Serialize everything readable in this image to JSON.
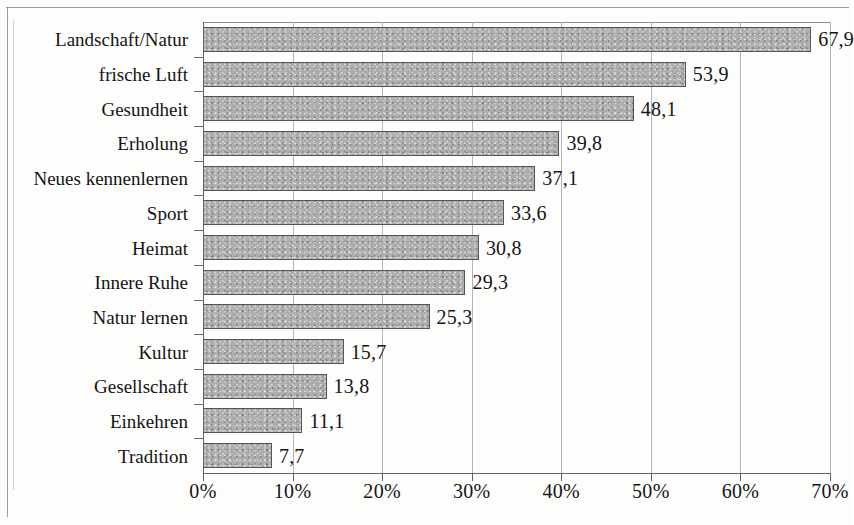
{
  "chart_data": {
    "type": "bar",
    "orientation": "horizontal",
    "title": "",
    "subtitle": "",
    "xlabel": "",
    "ylabel": "",
    "categories": [
      "Landschaft/Natur",
      "frische Luft",
      "Gesundheit",
      "Erholung",
      "Neues kennenlernen",
      "Sport",
      "Heimat",
      "Innere Ruhe",
      "Natur lernen",
      "Kultur",
      "Gesellschaft",
      "Einkehren",
      "Tradition"
    ],
    "values": [
      67.9,
      53.9,
      48.1,
      39.8,
      37.1,
      33.6,
      30.8,
      29.3,
      25.3,
      15.7,
      13.8,
      11.1,
      7.7
    ],
    "value_labels": [
      "67,9",
      "53,9",
      "48,1",
      "39,8",
      "37,1",
      "33,6",
      "30,8",
      "29,3",
      "25,3",
      "15,7",
      "13,8",
      "11,1",
      "7,7"
    ],
    "xlim": [
      0,
      70
    ],
    "xtick_values": [
      0,
      10,
      20,
      30,
      40,
      50,
      60,
      70
    ],
    "xtick_labels": [
      "0%",
      "10%",
      "20%",
      "30%",
      "40%",
      "50%",
      "60%",
      "70%"
    ],
    "grid": "vertical",
    "legend": "none",
    "bar_color": "#aeaeae",
    "bar_border_color": "#555555",
    "axis_color": "#636363",
    "gridline_color": "#b4b4b4",
    "text_color": "#141414",
    "background_color": "#fdfdfc"
  }
}
